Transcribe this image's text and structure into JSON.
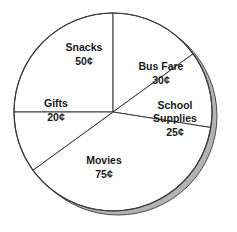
{
  "chart_data": {
    "type": "pie",
    "title": "",
    "subtitle": "",
    "xlabel": "",
    "ylabel": "",
    "legend_position": "none",
    "grid": false,
    "unit": "¢",
    "total": 200,
    "categories": [
      "Snacks",
      "Bus Fare",
      "School Supplies",
      "Movies",
      "Gifts"
    ],
    "values": [
      50,
      30,
      25,
      75,
      20
    ],
    "value_labels": [
      "50¢",
      "30¢",
      "25¢",
      "75¢",
      "20¢"
    ],
    "slices": [
      {
        "name": "Snacks",
        "value": 50,
        "value_label": "50¢",
        "label_line1": "Snacks",
        "label_line2": "50¢",
        "start_angle": 180,
        "sweep_angle": 90,
        "label_x": 84,
        "label_y": 48,
        "value_x": 84,
        "value_y": 62
      },
      {
        "name": "Bus Fare",
        "value": 30,
        "value_label": "30¢",
        "label_line1": "Bus Fare",
        "label_line2": "30¢",
        "start_angle": 270,
        "sweep_angle": 54,
        "label_x": 161,
        "label_y": 67,
        "value_x": 161,
        "value_y": 81
      },
      {
        "name": "School Supplies",
        "value": 25,
        "value_label": "25¢",
        "label_line1": "School",
        "label_line2": "Supplies",
        "label_line3": "25¢",
        "start_angle": 324,
        "sweep_angle": 45,
        "label_x": 175,
        "label_y": 106,
        "value_x": 175,
        "value_y": 133
      },
      {
        "name": "Movies",
        "value": 75,
        "value_label": "75¢",
        "label_line1": "Movies",
        "label_line2": "75¢",
        "start_angle": 9,
        "sweep_angle": 135,
        "label_x": 104,
        "label_y": 161,
        "value_x": 104,
        "value_y": 175
      },
      {
        "name": "Gifts",
        "value": 20,
        "value_label": "20¢",
        "label_line1": "Gifts",
        "label_line2": "20¢",
        "start_angle": 144,
        "sweep_angle": 36,
        "label_x": 56,
        "label_y": 104,
        "value_x": 56,
        "value_y": 118
      }
    ],
    "geometry": {
      "center_x": 113,
      "center_y": 112,
      "radius": 99,
      "shadow_offset_x": 5,
      "shadow_offset_y": 4
    },
    "colors": {
      "slice_fill": "#ffffff",
      "outline": "#3b3b3b",
      "shadow": "#b3b3b3",
      "shadow_outline": "#4a4a4a",
      "background": "#ffffff",
      "text": "#1a1a1a"
    }
  }
}
